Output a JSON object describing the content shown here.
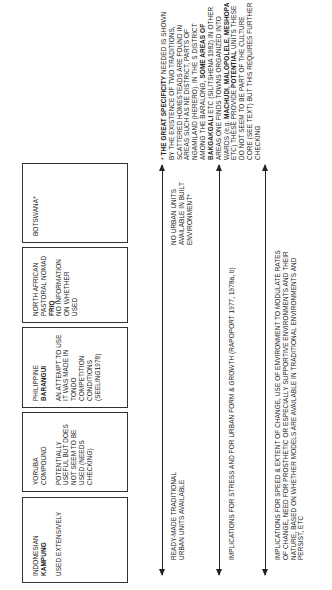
{
  "orientation": "rotated 90 degrees counter-clockwise",
  "boxes": [
    {
      "region": "INDONESIAN",
      "term": "KAMPUNG",
      "note": "USED EXTENSIVELY"
    },
    {
      "region": "YORUBA",
      "term": "COMPOUND",
      "note": "POTENTIALLY USEFUL BUT DOES NOT SEEM TO BE USED (NEEDS CHECKING)"
    },
    {
      "region": "PHILIPPINE",
      "term": "BARANGUI",
      "note": "AN ATTEMPT TO USE IT WAS MADE IN TONDO COMPETITION CONDITIONS (SEELING1978)"
    },
    {
      "region": "NORTH AFRICAN PASTORAL NOMAD",
      "term": "FRIQ",
      "note": "NO INFORMATION ON WHETHER USED"
    },
    {
      "region": "BOTSWANA*",
      "term": "",
      "note": ""
    }
  ],
  "arrows": [
    {
      "left_label": "READY-MADE TRADITIONAL\nURBAN UNITS AVAILABLE",
      "right_label": "NO URBAN UNITS\nAVAILABLE IN BUILT\nENVIRONMENT*"
    },
    {
      "left_label": "IMPLICATIONS FOR STRESS AND FOR URBAN FORM & GROWTH (RAPOPORT 1977, 1978a, b)"
    },
    {
      "left_label": "IMPLICATIONS FOR SPEED & EXTENT OF CHANGE, USE OF ENVIRONMENT TO MODULATE RATES\nOF CHANGE, NEED FOR PROSTHETIC OR ESPECIALLY SUPPORTIVE ENVIRONMENTS AND THEIR\nNATURE, BASED ON WHETHER MODELS ARE AVAILABLE IN TRADITIONAL ENVIRONMENTS AND\nPERSIST, ETC"
    }
  ],
  "footnote": {
    "marker": "*",
    "lead": "THE GREAT SPECIFICITY",
    "text_1": "NEEDED IS SHOWN BY THE EXISTENCE OF TWO TRADITIONS, SCATTERED HOMESTEADS ARE FOUND IN AREAS SUCH AS NE DISTRICT, PARTS OF NGAMILAND (HERERO). IN THE S DISTRICT AMONG THE BARALONG,",
    "bold_1": "SOME AREAS OF BAKGAKGALI",
    "text_2": "ETC (SILITSHENA 1982) IN OTHER AREAS ONE FINDS TOWNS ORGANIZED INTO WARDS (e.g.",
    "bold_2": "MACHUDI, MALOPOLELE, MESHOPA",
    "text_3": "ETC) THESE PROVIDE",
    "bold_3": "POTENTIAL",
    "text_4": "UNITS THESE DO NOT SEEM TO BE PART OF THE CULTURE CORE (SEE TEXT) BUT THIS REQUIRES FURTHER CHECKING"
  }
}
